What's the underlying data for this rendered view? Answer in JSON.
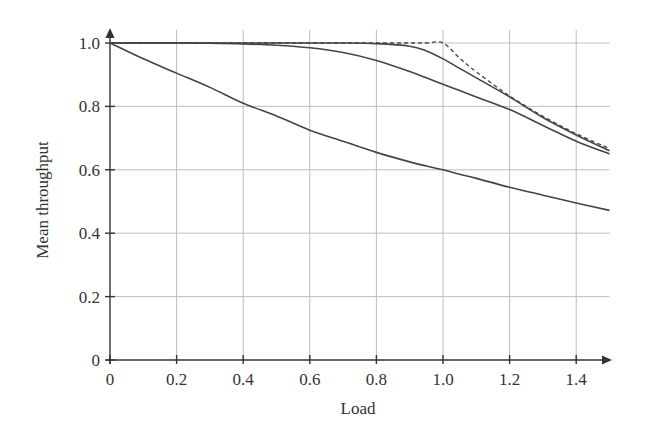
{
  "chart_data": {
    "type": "line",
    "title": "",
    "xlabel": "Load",
    "ylabel": "Mean throughput",
    "xlim": [
      0,
      1.5
    ],
    "ylim": [
      0,
      1.05
    ],
    "xticks": [
      0,
      0.2,
      0.4,
      0.6,
      0.8,
      1.0,
      1.2,
      1.4
    ],
    "xtick_labels": [
      "0",
      "0.2",
      "0.4",
      "0.6",
      "0.8",
      "1.0",
      "1.2",
      "1.4"
    ],
    "yticks": [
      0,
      0.2,
      0.4,
      0.6,
      0.8,
      1.0
    ],
    "ytick_labels": [
      "0",
      "0.2",
      "0.4",
      "0.6",
      "0.8",
      "1.0"
    ],
    "grid": true,
    "legend": null,
    "x": [
      0,
      0.1,
      0.2,
      0.3,
      0.4,
      0.5,
      0.6,
      0.7,
      0.8,
      0.9,
      0.95,
      1.0,
      1.05,
      1.1,
      1.2,
      1.3,
      1.4,
      1.5
    ],
    "series": [
      {
        "name": "upper bound min(1, 1/load) (dashed)",
        "style": "dashed",
        "values": [
          1.0,
          1.0,
          1.0,
          1.0,
          1.0,
          1.0,
          1.0,
          1.0,
          1.0,
          1.0,
          1.0,
          1.0,
          0.952,
          0.909,
          0.833,
          0.769,
          0.714,
          0.667
        ]
      },
      {
        "name": "curve 1 (sharp knee)",
        "style": "solid",
        "values": [
          1.0,
          1.0,
          1.0,
          1.0,
          1.0,
          1.0,
          1.0,
          1.0,
          0.998,
          0.99,
          0.975,
          0.95,
          0.92,
          0.89,
          0.83,
          0.765,
          0.71,
          0.66
        ]
      },
      {
        "name": "curve 2 (gradual)",
        "style": "solid",
        "values": [
          1.0,
          1.0,
          1.0,
          0.999,
          0.997,
          0.993,
          0.985,
          0.97,
          0.945,
          0.91,
          0.89,
          0.87,
          0.85,
          0.83,
          0.79,
          0.74,
          0.69,
          0.65
        ]
      },
      {
        "name": "curve 3 (lowest)",
        "style": "solid",
        "values": [
          1.0,
          0.95,
          0.905,
          0.86,
          0.81,
          0.77,
          0.725,
          0.69,
          0.655,
          0.625,
          0.612,
          0.6,
          0.586,
          0.573,
          0.545,
          0.52,
          0.495,
          0.472
        ]
      }
    ]
  }
}
